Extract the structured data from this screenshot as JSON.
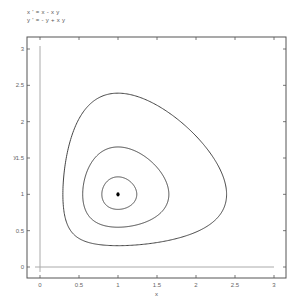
{
  "chart_data": {
    "type": "line",
    "title_lines": [
      "x ' = x - x y",
      "y ' = - y + x y"
    ],
    "xlabel": "x",
    "ylabel": "y",
    "xlim": [
      -0.17,
      3.15
    ],
    "ylim": [
      -0.15,
      3.17
    ],
    "xticks": [
      0,
      0.5,
      1,
      1.5,
      2,
      2.5,
      3
    ],
    "xtick_labels": [
      "0",
      "0.5",
      "1",
      "1.5",
      "2",
      "2.5",
      "3"
    ],
    "yticks": [
      0,
      0.5,
      1,
      1.5,
      2,
      2.5,
      3
    ],
    "ytick_labels": [
      "0",
      "0.5",
      "1",
      "1.5",
      "2",
      "2.5",
      "3"
    ],
    "grid": false,
    "reference_lines": [
      {
        "orientation": "vertical",
        "x": 0,
        "y_range": [
          0,
          3
        ]
      },
      {
        "orientation": "horizontal",
        "y": 0,
        "x_range": [
          0,
          3
        ]
      }
    ],
    "equilibrium_point": {
      "x": 1,
      "y": 1
    },
    "series": [
      {
        "name": "orbit-inner",
        "invariant": "x - ln(x) + y - ln(y)",
        "level": 2.025,
        "x_extent": [
          0.79,
          1.23
        ]
      },
      {
        "name": "orbit-middle",
        "invariant": "x - ln(x) + y - ln(y)",
        "level": 2.15,
        "x_extent": [
          0.54,
          1.64
        ]
      },
      {
        "name": "orbit-outer",
        "invariant": "x - ln(x) + y - ln(y)",
        "level": 2.52,
        "x_extent": [
          0.29,
          2.38
        ]
      }
    ],
    "colors": {
      "axes": "#555555",
      "reference": "#aaaaaa",
      "curve": "#444444",
      "point": "#000000"
    }
  }
}
